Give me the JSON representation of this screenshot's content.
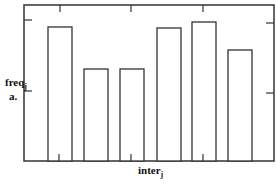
{
  "chart_data": {
    "type": "bar",
    "title": "",
    "xlabel": "inter",
    "xlabel_sub": "j",
    "ylabel": "freq",
    "ylabel_sub": "j",
    "panel_label": "a.",
    "categories": [
      "1",
      "2",
      "3",
      "4",
      "5",
      "6"
    ],
    "values": [
      134,
      92,
      92,
      133,
      139,
      111
    ],
    "ylim": [
      0,
      156
    ],
    "grid": false,
    "legend": null,
    "bar_style": {
      "fill": "#ffffff",
      "stroke": "#333333"
    },
    "tick_labels_shown": false
  },
  "layout": {
    "frame": {
      "left": 24,
      "top": 5,
      "right": 274,
      "bottom": 161
    },
    "bar_x": [
      48,
      84,
      120,
      157,
      192,
      228
    ],
    "bar_width": 24,
    "top_ticks_x": [
      60,
      131,
      203
    ],
    "bottom_ticks_x": [
      59,
      131,
      203
    ],
    "left_ticks_y": [
      20,
      91
    ],
    "right_ticks_y": [
      23,
      93
    ]
  }
}
